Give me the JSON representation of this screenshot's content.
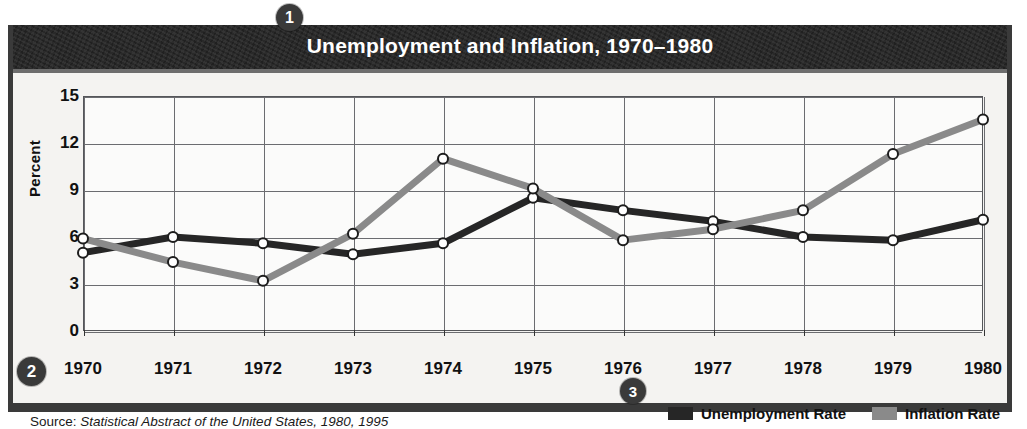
{
  "figure": {
    "title": "Unemployment and Inflation, 1970–1980",
    "source_label": "Source:",
    "source_body": "Statistical Abstract of the United States, 1980, 1995"
  },
  "callouts": {
    "one": "1",
    "two": "2",
    "three": "3"
  },
  "colors": {
    "frame": "#3a3a3a",
    "title_bar": "#232323",
    "unemployment": "#262626",
    "inflation": "#8a8a8a",
    "grid": "#6b6c70",
    "plot_background": "#fbfbfa",
    "page_background": "#f4f3f1"
  },
  "legend": {
    "items": [
      {
        "label": "Unemployment Rate",
        "swatch": "#262626",
        "key": "unemployment"
      },
      {
        "label": "Inflation Rate",
        "swatch": "#8a8a8a",
        "key": "inflation"
      }
    ]
  },
  "chart_data": {
    "type": "line",
    "title": "Unemployment and Inflation, 1970–1980",
    "xlabel": "",
    "ylabel": "Percent",
    "x": [
      1970,
      1971,
      1972,
      1973,
      1974,
      1975,
      1976,
      1977,
      1978,
      1979,
      1980
    ],
    "categories": [
      "1970",
      "1971",
      "1972",
      "1973",
      "1974",
      "1975",
      "1976",
      "1977",
      "1978",
      "1979",
      "1980"
    ],
    "xtick_labels": [
      "1970",
      "1971",
      "1972",
      "1973",
      "1974",
      "1975",
      "1976",
      "1977",
      "1978",
      "1979",
      "1980"
    ],
    "ytick_labels": [
      "0",
      "3",
      "6",
      "9",
      "12",
      "15"
    ],
    "yticks": [
      0,
      3,
      6,
      9,
      12,
      15
    ],
    "ylim": [
      0,
      15
    ],
    "grid": true,
    "legend_position": "bottom-right",
    "marker": "open-circle",
    "series": [
      {
        "name": "Unemployment Rate",
        "color": "#262626",
        "values": [
          5.0,
          6.0,
          5.6,
          4.9,
          5.6,
          8.5,
          7.7,
          7.0,
          6.0,
          5.8,
          7.1
        ]
      },
      {
        "name": "Inflation Rate",
        "color": "#8a8a8a",
        "values": [
          5.9,
          4.4,
          3.2,
          6.2,
          11.0,
          9.1,
          5.8,
          6.5,
          7.7,
          11.3,
          13.5
        ]
      }
    ]
  }
}
